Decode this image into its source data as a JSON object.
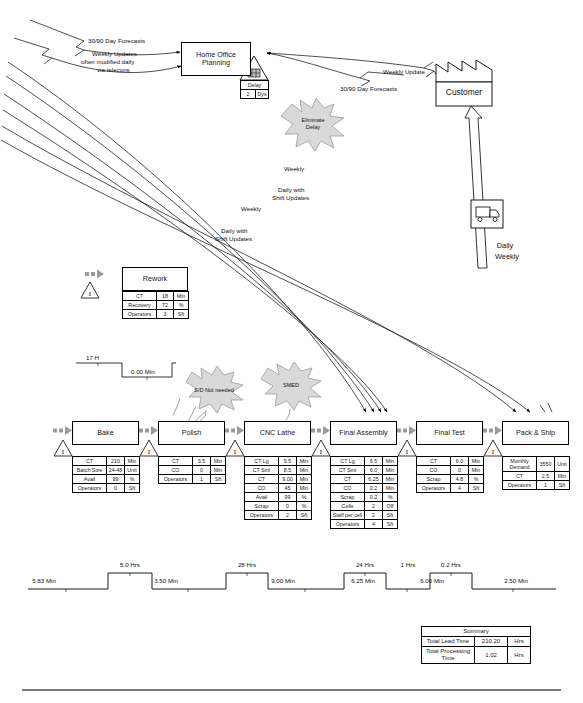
{
  "diagram": {
    "type": "value-stream-map"
  },
  "information_flow": {
    "home_office": {
      "line1": "Home Office",
      "line2": "Planning"
    },
    "customer": {
      "label": "Customer"
    },
    "delay_icon": {
      "label": "Delay",
      "value": "2",
      "unit": "Dys"
    },
    "arrow_labels": {
      "forecast_top": "30/90 Day Forecasts",
      "weekly_updates_l1": "Weekly Updates",
      "weekly_updates_l2": "often modified daily",
      "weekly_updates_l3": "via telecons",
      "weekly_update_cust": "Weekly Update",
      "forecast_cust": "30/90 Day Forecasts",
      "sched_weekly_1": "Weekly",
      "sched_daily_1_l1": "Daily with",
      "sched_daily_1_l2": "Shift Updates",
      "sched_weekly_2": "Weekly",
      "sched_daily_2_l1": "Daily with",
      "sched_daily_2_l2": "Shift Updates",
      "shipping_daily": "Daily",
      "shipping_weekly": "Weekly"
    }
  },
  "kaizen_bursts": [
    {
      "name": "eliminate-delay",
      "line1": "Eliminate",
      "line2": "Delay",
      "fill": "#d9d9d9"
    },
    {
      "name": "sd-not-needed",
      "line1": "S/D Not needed",
      "line2": "",
      "fill": "#d9d9d9"
    },
    {
      "name": "smed",
      "line1": "SMED",
      "line2": "",
      "fill": "#d9d9d9"
    }
  ],
  "rework": {
    "title": "Rework",
    "rows": [
      {
        "key": "CT",
        "value": "18",
        "unit": "Min"
      },
      {
        "key": "Recovery",
        "value": "72",
        "unit": "%"
      },
      {
        "key": "Operators",
        "value": "3",
        "unit": "Sft"
      }
    ],
    "timeline": {
      "lead": "17 H",
      "process": "0.00 Min"
    }
  },
  "processes": [
    {
      "name": "bake",
      "title": "Bake",
      "rows": [
        {
          "key": "CT",
          "value": "210",
          "unit": "Min"
        },
        {
          "key": "Batch Size",
          "value": "24-48",
          "unit": "Unit"
        },
        {
          "key": "Avail",
          "value": "99",
          "unit": "%"
        },
        {
          "key": "Operators",
          "value": "0",
          "unit": "Sft"
        }
      ]
    },
    {
      "name": "polish",
      "title": "Polish",
      "rows": [
        {
          "key": "CT",
          "value": "3.5",
          "unit": "Min"
        },
        {
          "key": "CO",
          "value": "0",
          "unit": "Min"
        },
        {
          "key": "Operators",
          "value": "1",
          "unit": "Sft"
        }
      ]
    },
    {
      "name": "cnc-lathe",
      "title": "CNC Lathe",
      "rows": [
        {
          "key": "CT Lg",
          "value": "9.5",
          "unit": "Min"
        },
        {
          "key": "CT Sml",
          "value": "8.5",
          "unit": "Min"
        },
        {
          "key": "CT",
          "value": "9.00",
          "unit": "Min"
        },
        {
          "key": "CO",
          "value": "45",
          "unit": "Min"
        },
        {
          "key": "Avail",
          "value": "99",
          "unit": "%"
        },
        {
          "key": "Scrap",
          "value": "0",
          "unit": "%"
        },
        {
          "key": "Operators",
          "value": "2",
          "unit": "Sft"
        }
      ]
    },
    {
      "name": "final-assembly",
      "title": "Final Assembly",
      "rows": [
        {
          "key": "CT Lg",
          "value": "6.5",
          "unit": "Min"
        },
        {
          "key": "CT Sml",
          "value": "6.0",
          "unit": "Min"
        },
        {
          "key": "CT",
          "value": "6.25",
          "unit": "Min"
        },
        {
          "key": "CO",
          "value": "0.2",
          "unit": "Min"
        },
        {
          "key": "Scrap",
          "value": "0.2",
          "unit": "%"
        },
        {
          "key": "Cells",
          "value": "2",
          "unit": "Off"
        },
        {
          "key": "Staff per cell",
          "value": "2",
          "unit": "Sft"
        },
        {
          "key": "Operators",
          "value": "4",
          "unit": "Sft"
        }
      ]
    },
    {
      "name": "final-test",
      "title": "Final Test",
      "rows": [
        {
          "key": "CT",
          "value": "6.0",
          "unit": "Min"
        },
        {
          "key": "CO",
          "value": "0",
          "unit": "Min"
        },
        {
          "key": "Scrap",
          "value": "4.8",
          "unit": "%"
        },
        {
          "key": "Operators",
          "value": "4",
          "unit": "Sft"
        }
      ]
    },
    {
      "name": "pack-and-ship",
      "title": "Pack & Ship",
      "rows": [
        {
          "key": "Monthly Demand",
          "value": "3550",
          "unit": "Unit"
        },
        {
          "key": "CT",
          "value": "2.5",
          "unit": "Min"
        },
        {
          "key": "Operators",
          "value": "1",
          "unit": "Sft"
        }
      ]
    }
  ],
  "timeline": {
    "process_times": [
      "5.83  Min",
      "3.50  Min",
      "9.00  Min",
      "6.25  Min",
      "6.00  Min",
      "2.50  Min"
    ],
    "lead_times": [
      "5.0  Hrs",
      "28  Hrs",
      "24  Hrs",
      "1  Hrs",
      "0.2  Hrs"
    ]
  },
  "summary": {
    "header": "Summary",
    "rows": [
      {
        "key": "Total Lead Time",
        "value": "210.20",
        "unit": "Hrs"
      },
      {
        "key": "Total Processing Time",
        "value": "1.02",
        "unit": "Hrs"
      }
    ]
  }
}
